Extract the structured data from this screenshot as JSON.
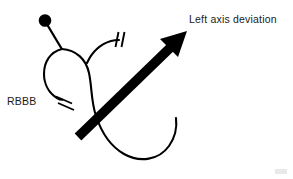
{
  "figure": {
    "name": "cardiac-conduction-block-diagram",
    "width": 293,
    "height": 179,
    "background_color": "#ffffff",
    "stroke_color": "#000000",
    "text_color": "#1a1a1a"
  },
  "labels": {
    "rbbb": "RBBB",
    "left_axis_deviation": "Left axis deviation"
  },
  "annotations": {
    "node_marker": "filled-circle-node",
    "block_marker_glyph": "double-slash-block",
    "arrow_glyph": "thick-solid-arrow"
  },
  "elements": [
    {
      "name": "his-bundle-node",
      "type": "filled-circle",
      "cx": 45,
      "cy": 21,
      "r": 6.2
    },
    {
      "name": "his-bundle-stem",
      "type": "line",
      "x1": 45,
      "y1": 21,
      "x2": 61,
      "y2": 48
    },
    {
      "name": "right-bundle-branch-curve",
      "type": "path",
      "description": "left-descending loop ending at RBBB block"
    },
    {
      "name": "left-bundle-branch-curve",
      "type": "path",
      "description": "central loop descending to lower right sweep"
    },
    {
      "name": "left-anterior-fascicle-curve",
      "type": "path",
      "description": "short upward curve ending at block marker"
    },
    {
      "name": "rbbb-block-marker",
      "type": "double-slash",
      "x": 62,
      "y": 99
    },
    {
      "name": "fascicular-block-marker",
      "type": "double-slash",
      "x": 120,
      "y": 40
    },
    {
      "name": "left-axis-deviation-arrow",
      "type": "arrow",
      "x1": 78,
      "y1": 137,
      "x2": 186,
      "y2": 33
    }
  ]
}
